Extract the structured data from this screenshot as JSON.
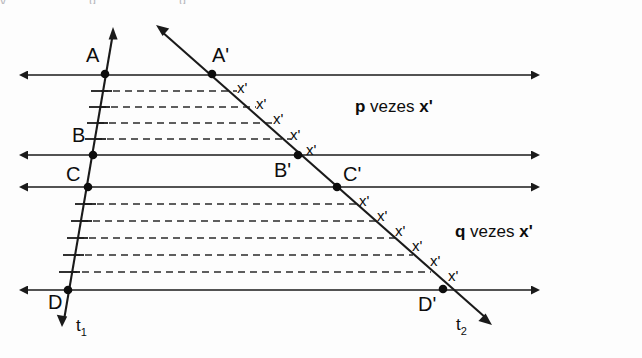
{
  "figure": {
    "credit": "Banco de imagens/Arquivo da editora",
    "width": 642,
    "height": 358,
    "background_color": "#fdfdfd",
    "line_color": "#1a1a1a",
    "dash_color": "#2a2a2a"
  },
  "transversals": [
    {
      "id": "t1",
      "label": "t",
      "subscript": "1"
    },
    {
      "id": "t2",
      "label": "t",
      "subscript": "2"
    }
  ],
  "points": [
    {
      "label": "A",
      "x": 105,
      "y": 74,
      "lx": 86,
      "ly": 62,
      "line": "t1"
    },
    {
      "label": "B",
      "x": 93,
      "y": 155,
      "lx": 72,
      "ly": 142,
      "line": "t1"
    },
    {
      "label": "C",
      "x": 88,
      "y": 187,
      "lx": 66,
      "ly": 181,
      "line": "t1"
    },
    {
      "label": "D",
      "x": 68,
      "y": 290,
      "lx": 48,
      "ly": 309,
      "line": "t1"
    },
    {
      "label": "A'",
      "x": 212,
      "y": 74,
      "lx": 223,
      "ly": 62,
      "line": "t2"
    },
    {
      "label": "B'",
      "x": 298,
      "y": 155,
      "lx": 278,
      "ly": 175,
      "line": "t2"
    },
    {
      "label": "C'",
      "x": 337,
      "y": 187,
      "lx": 347,
      "ly": 181,
      "line": "t2"
    },
    {
      "label": "D'",
      "x": 443,
      "y": 289,
      "lx": 422,
      "ly": 309,
      "line": "t2"
    }
  ],
  "parallel_lines": [
    {
      "name": "line-through-A",
      "y": 75,
      "x_left": 18,
      "x_right": 540
    },
    {
      "name": "line-through-B",
      "y": 155,
      "x_left": 18,
      "x_right": 540
    },
    {
      "name": "line-through-C",
      "y": 187,
      "x_left": 18,
      "x_right": 540
    },
    {
      "name": "line-through-D",
      "y": 290,
      "x_left": 18,
      "x_right": 540
    }
  ],
  "annotations": {
    "upper": {
      "count_label": "p",
      "text": " vezes ",
      "unit": "x'",
      "x": 355,
      "y": 112
    },
    "lower": {
      "count_label": "q",
      "text": " vezes ",
      "unit": "x'",
      "x": 455,
      "y": 237
    }
  },
  "segments": {
    "upper": {
      "name": "segment-AB",
      "divisions": 5,
      "ticks": 4,
      "unit_label": "x'",
      "unit_count_on_t2": 5
    },
    "lower": {
      "name": "segment-CD",
      "divisions": 6,
      "ticks": 5,
      "unit_label": "x'",
      "unit_count_on_t2": 6
    }
  },
  "unit_marks_t2_upper": [
    {
      "label": "x'",
      "x": 237,
      "y": 93
    },
    {
      "label": "x'",
      "x": 256,
      "y": 109
    },
    {
      "label": "x'",
      "x": 273,
      "y": 124
    },
    {
      "label": "x'",
      "x": 290,
      "y": 140
    },
    {
      "label": "x'",
      "x": 306,
      "y": 155
    }
  ],
  "unit_marks_t2_lower": [
    {
      "label": "x'",
      "x": 359,
      "y": 206
    },
    {
      "label": "x'",
      "x": 377,
      "y": 221
    },
    {
      "label": "x'",
      "x": 395,
      "y": 236
    },
    {
      "label": "x'",
      "x": 412,
      "y": 251
    },
    {
      "label": "x'",
      "x": 430,
      "y": 266
    },
    {
      "label": "x'",
      "x": 448,
      "y": 281
    }
  ]
}
